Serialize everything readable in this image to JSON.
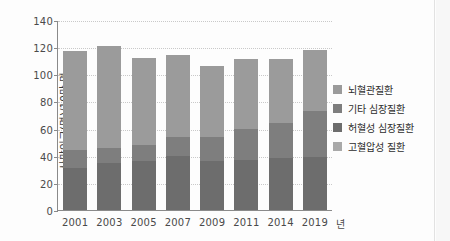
{
  "chart_data": {
    "type": "bar",
    "stacked": true,
    "title": "",
    "xlabel": "년",
    "ylabel": "사망인구(명)/10만 명",
    "categories": [
      "2001",
      "2003",
      "2005",
      "2007",
      "2009",
      "2011",
      "2014",
      "2019"
    ],
    "ylim": [
      0,
      140
    ],
    "yticks": [
      0,
      20,
      40,
      60,
      80,
      100,
      120,
      140
    ],
    "grid": true,
    "legend_position": "right",
    "series": [
      {
        "name": "뇌혈관질환",
        "color": "#9b9b9b",
        "values": [
          73,
          75,
          64,
          60,
          52,
          51,
          47,
          45
        ]
      },
      {
        "name": "기타 심장질환",
        "color": "#7e7e7e",
        "values": [
          13,
          11,
          12,
          14,
          18,
          23,
          26,
          34
        ]
      },
      {
        "name": "허혈성 심장질환",
        "color": "#6d6d6d",
        "values": [
          31,
          35,
          36,
          40,
          36,
          37,
          38,
          39
        ]
      },
      {
        "name": "고혈압성 질환",
        "color": "#a9a9a9",
        "values": [
          0,
          0,
          0,
          0,
          0,
          0,
          0,
          0
        ]
      }
    ],
    "totals": [
      117,
      121,
      112,
      114,
      106,
      111,
      111,
      118
    ],
    "segment_tops": {
      "2001": [
        31,
        44,
        117
      ],
      "2003": [
        35,
        46,
        121
      ],
      "2005": [
        36,
        48,
        112
      ],
      "2007": [
        40,
        54,
        114
      ],
      "2009": [
        36,
        54,
        106
      ],
      "2011": [
        37,
        60,
        111
      ],
      "2014": [
        38,
        64,
        111
      ],
      "2019": [
        39,
        73,
        118
      ]
    }
  },
  "legend": {
    "items": [
      {
        "label": "뇌혈관질환"
      },
      {
        "label": "기타 심장질환"
      },
      {
        "label": "허혈성 심장질환"
      },
      {
        "label": "고혈압성 질환"
      }
    ]
  },
  "axes": {
    "y_title": "사망인구(명)/10만 명",
    "x_unit": "년",
    "y_ticks": [
      "140",
      "120",
      "100",
      "80",
      "60",
      "40",
      "20",
      "0"
    ],
    "x_ticks": [
      "2001",
      "2003",
      "2005",
      "2007",
      "2009",
      "2011",
      "2014",
      "2019"
    ]
  }
}
